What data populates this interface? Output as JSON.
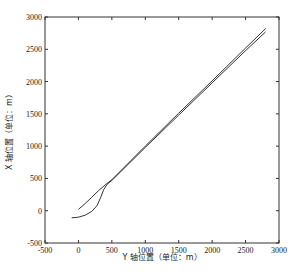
{
  "chart_data": {
    "type": "line",
    "title": "",
    "xlabel": "Y 轴位置（单位：m）",
    "ylabel": "X 轴位置（单位：m）",
    "xlim": [
      -500,
      3000
    ],
    "ylim": [
      -500,
      3000
    ],
    "xticks": [
      -500,
      0,
      500,
      1000,
      1500,
      2000,
      2500,
      3000
    ],
    "yticks": [
      -500,
      0,
      500,
      1000,
      1500,
      2000,
      2500,
      3000
    ],
    "grid": false,
    "legend": null,
    "series": [
      {
        "name": "trajectory-1",
        "x": [
          0,
          100,
          200,
          300,
          400,
          500,
          1000,
          1500,
          2000,
          2500,
          2800
        ],
        "y": [
          20,
          110,
          210,
          310,
          400,
          480,
          1000,
          1510,
          2010,
          2520,
          2820
        ]
      },
      {
        "name": "trajectory-2",
        "x": [
          -100,
          0,
          100,
          200,
          280,
          330,
          380,
          430,
          500,
          1000,
          1500,
          2000,
          2500,
          2800
        ],
        "y": [
          -110,
          -100,
          -70,
          -10,
          80,
          200,
          330,
          410,
          470,
          980,
          1480,
          1980,
          2480,
          2770
        ]
      }
    ]
  }
}
